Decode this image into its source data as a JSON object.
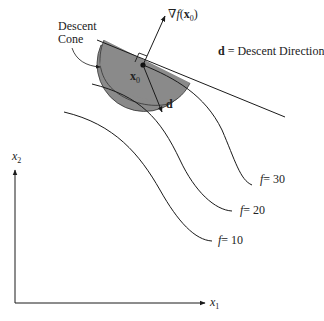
{
  "diagram": {
    "labels": {
      "descent_cone_line1": "Descent",
      "descent_cone_line2": "Cone",
      "gradient_prefix": "∇",
      "gradient_f": "f",
      "gradient_open": "(",
      "gradient_x": "x",
      "gradient_sub": "0",
      "gradient_close": ")",
      "x0_base": "x",
      "x0_sub": "0",
      "d": "d",
      "legend_d": "d",
      "legend_text": " = Descent Direction",
      "x1_base": "x",
      "x1_sub": "1",
      "x2_base": "x",
      "x2_sub": "2"
    },
    "contours": [
      {
        "f": "f",
        "label": "= 30"
      },
      {
        "f": "f",
        "label": "= 20"
      },
      {
        "f": "f",
        "label": "= 10"
      }
    ],
    "colors": {
      "cone_fill": "#8a8a8a",
      "line": "#1a1a1a",
      "background": "#ffffff"
    }
  }
}
